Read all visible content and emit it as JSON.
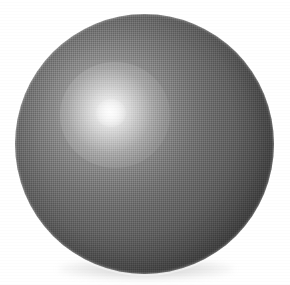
{
  "figure": {
    "rendering": "grayscale halftone-dithered shaded sphere on white background",
    "background_color": "#ffffff",
    "canvas": {
      "width_px": 290,
      "height_px": 285
    },
    "sphere": {
      "name": "sphere",
      "center_x_px": 145,
      "center_y_px": 144,
      "diameter_px": 259,
      "bounds": {
        "left_px": 15,
        "top_px": 14,
        "right_px": 274,
        "bottom_px": 274
      },
      "base_color": "#717171",
      "darkest_color": "#414141",
      "lightest_color": "#f2f2f2"
    },
    "highlight": {
      "name": "specular-highlight",
      "center_x_px": 111,
      "center_y_px": 113,
      "relative_x_pct": 36.5,
      "relative_y_pct": 37.5,
      "core_diameter_px": 30,
      "bloom_diameter_px": 110,
      "color": "#ffffff"
    },
    "shadow": {
      "name": "ground-shadow",
      "center_x_px": 146,
      "center_y_px": 269,
      "width_px": 176,
      "height_px": 22,
      "color": "#787878"
    },
    "texture": {
      "name": "halftone-dither",
      "pattern": "ordered checkerboard dither",
      "cell_size_px": 2
    },
    "lighting": {
      "direction": "upper-left",
      "model": "diffuse with specular highlight",
      "terminator_side": "lower-right"
    }
  }
}
